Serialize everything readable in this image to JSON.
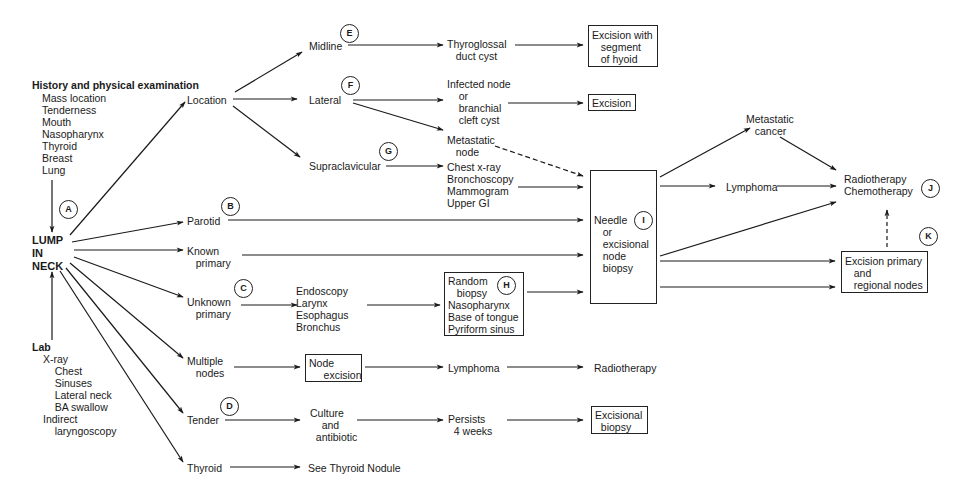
{
  "diagram": {
    "root": "LUMP\nIN\nNECK",
    "history": {
      "heading": "History and physical examination",
      "items": [
        "Mass location",
        "Tenderness",
        "Mouth",
        "Nasopharynx",
        "Thyroid",
        "Breast",
        "Lung"
      ]
    },
    "lab": {
      "heading": "Lab",
      "items": "X-ray\n    Chest\n    Sinuses\n    Lateral neck\n    BA swallow\nIndirect\n    laryngoscopy"
    },
    "markers": {
      "A": "A",
      "B": "B",
      "C": "C",
      "D": "D",
      "E": "E",
      "F": "F",
      "G": "G",
      "H": "H",
      "I": "I",
      "J": "J",
      "K": "K"
    },
    "branches": {
      "location": "Location",
      "midline": "Midline",
      "lateral": "Lateral",
      "supraclavicular": "Supraclavicular",
      "parotid": "Parotid",
      "known_primary": "Known\n   primary",
      "unknown_primary": "Unknown\n   primary",
      "multiple_nodes": "Multiple\n   nodes",
      "tender": "Tender",
      "thyroid": "Thyroid"
    },
    "nodes": {
      "thyroglossal": "Thyroglossal\n   duct cyst",
      "excision_hyoid": "Excision with\n   segment\n   of hyoid",
      "infected_node": "Infected node\n    or\n    branchial\n    cleft cyst",
      "excision": "Excision",
      "metastatic_node": "Metastatic\n   node",
      "workup": "Chest x-ray\nBronchoscopy\nMammogram\nUpper GI",
      "needle_biopsy": "Needle\n   or\n   excisional\n   node\n   biopsy",
      "metastatic_cancer": "Metastatic\n   cancer",
      "lymphoma_top": "Lymphoma",
      "radio_chemo": "Radiotherapy\nChemotherapy",
      "excision_primary": "Excision primary\n   and\n   regional nodes",
      "endoscopy": "Endoscopy\nLarynx\nEsophagus\nBronchus",
      "random_biopsy": "Random\n   biopsy\nNasopharynx\nBase of tongue\nPyriform sinus",
      "node_excision": "Node\n     excision",
      "lymphoma_bottom": "Lymphoma",
      "radiotherapy": "Radiotherapy",
      "culture": "Culture\n    and\n  antibiotic",
      "persists": "Persists\n  4 weeks",
      "excisional_biopsy": "Excisional\n  biopsy",
      "see_thyroid": "See Thyroid Nodule"
    }
  }
}
